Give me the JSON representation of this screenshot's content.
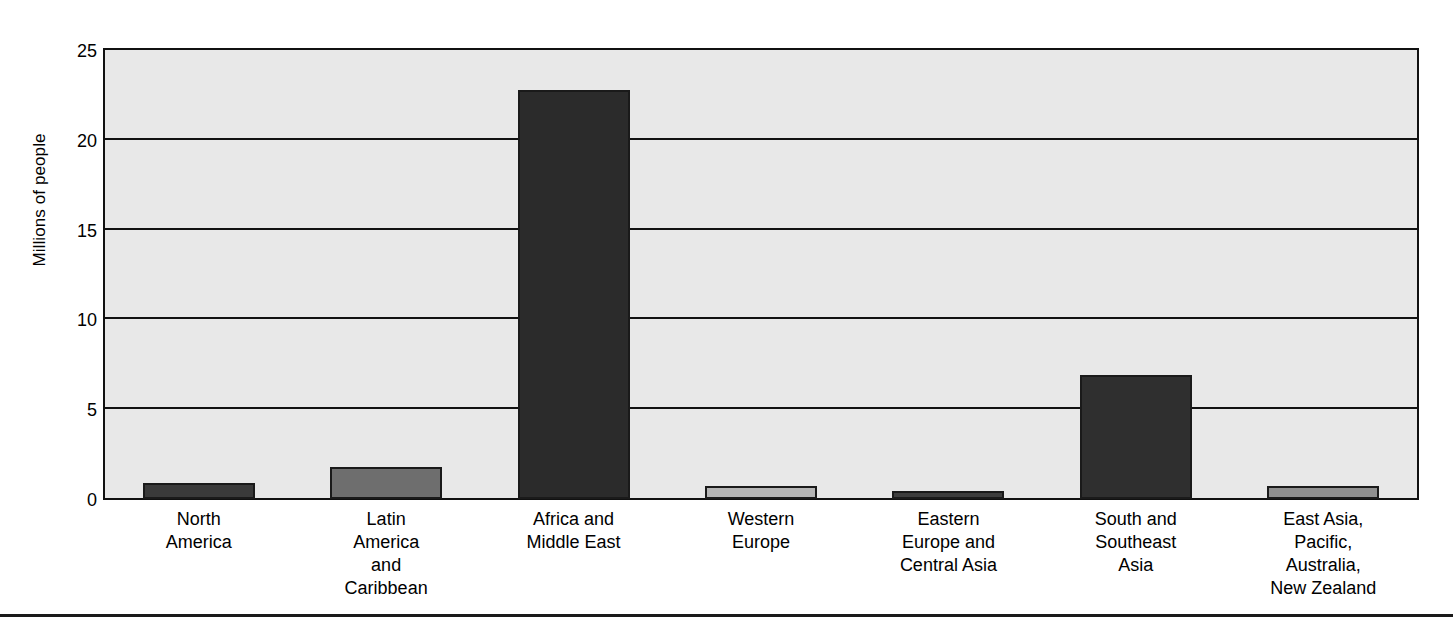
{
  "chart_data": {
    "type": "bar",
    "title": "",
    "xlabel": "",
    "ylabel": "Millions of people",
    "ylim": [
      0,
      25
    ],
    "yticks": [
      0,
      5,
      10,
      15,
      20,
      25
    ],
    "ytick_labels": [
      "0",
      "5",
      "10",
      "15",
      "20",
      "25"
    ],
    "grid": true,
    "legend": "none",
    "categories": [
      "North\nAmerica",
      "Latin\nAmerica\nand\nCaribbean",
      "Africa and\nMiddle East",
      "Western\nEurope",
      "Eastern\nEurope and\nCentral Asia",
      "South and\nSoutheast\nAsia",
      "East Asia,\nPacific,\nAustralia,\nNew Zealand"
    ],
    "category_lines": [
      [
        "North",
        "America"
      ],
      [
        "Latin",
        "America",
        "and",
        "Caribbean"
      ],
      [
        "Africa and",
        "Middle East"
      ],
      [
        "Western",
        "Europe"
      ],
      [
        "Eastern",
        "Europe and",
        "Central Asia"
      ],
      [
        "South and",
        "Southeast",
        "Asia"
      ],
      [
        "East Asia,",
        "Pacific,",
        "Australia,",
        "New Zealand"
      ]
    ],
    "values": [
      0.9,
      1.8,
      22.8,
      0.75,
      0.45,
      6.9,
      0.75
    ],
    "bar_colors": [
      "#3a3a3a",
      "#6e6e6e",
      "#2b2b2b",
      "#b5b5b5",
      "#3d3d3d",
      "#2f2f2f",
      "#8f8f8f"
    ]
  },
  "style": {
    "plot_background": "#e8e8e8",
    "axis_color": "#111111",
    "page_background": "#ffffff"
  }
}
